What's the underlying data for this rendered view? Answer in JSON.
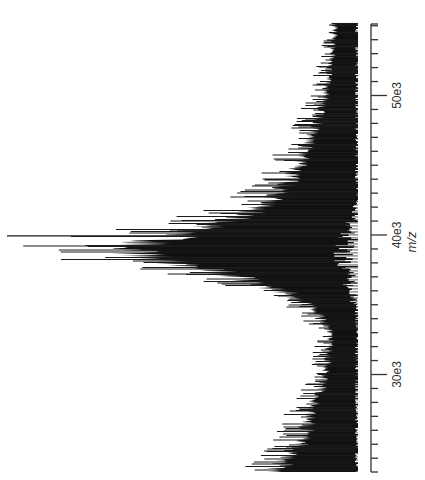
{
  "chart_data": {
    "type": "bar",
    "subtype": "mass-spectrum-stick",
    "orientation": "rotated-90",
    "title": "",
    "xlabel": "m/z",
    "ylabel": "",
    "x_tick_labels": [
      "30e3",
      "40e3",
      "50e3"
    ],
    "x_major_ticks": [
      30000,
      40000,
      50000
    ],
    "x_minor_tick_step": 1000,
    "xlim": [
      23300,
      55300
    ],
    "grid": false,
    "legend": null,
    "colors": {
      "spectrum": "#111111",
      "axis": "#333333",
      "text": "#333333"
    },
    "envelope": {
      "description": "relative intensity envelope (0-1) vs m/z; broad peak near 39e3",
      "x": [
        23300,
        25000,
        27000,
        29000,
        31000,
        33000,
        35000,
        36500,
        37500,
        38300,
        39000,
        39800,
        40500,
        41500,
        43000,
        45000,
        47000,
        49000,
        51000,
        53000,
        55300
      ],
      "y": [
        0.34,
        0.24,
        0.2,
        0.16,
        0.13,
        0.12,
        0.2,
        0.38,
        0.62,
        0.86,
        0.97,
        0.8,
        0.62,
        0.46,
        0.34,
        0.26,
        0.2,
        0.16,
        0.13,
        0.11,
        0.1
      ]
    },
    "peak": {
      "mz": 39000,
      "relative_intensity": 1.0
    }
  },
  "axis": {
    "label": "m/z",
    "ticks": [
      {
        "value": 30000,
        "label": "30e3"
      },
      {
        "value": 40000,
        "label": "40e3"
      },
      {
        "value": 50000,
        "label": "50e3"
      }
    ]
  }
}
